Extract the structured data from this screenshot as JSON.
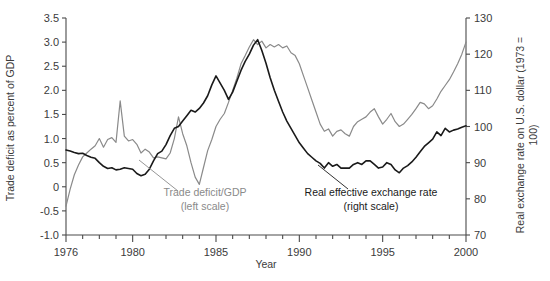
{
  "chart_data": {
    "type": "line",
    "title": "",
    "xlabel": "Year",
    "ylabel_left": "Trade deficit as percent of GDP",
    "ylabel_right": "Real exchange rate on U.S. dollar (1973 = 100)",
    "xlim": [
      1976,
      2000
    ],
    "xticks_major": [
      1976,
      1980,
      1985,
      1990,
      1995,
      2000
    ],
    "xtick_labels": [
      "1976",
      "1980",
      "1985",
      "1990",
      "1995",
      "2000"
    ],
    "xtick_minor_step": 1,
    "ylim_left": [
      -1.0,
      3.5
    ],
    "yticks_left": [
      -1.0,
      -0.5,
      0.0,
      0.5,
      1.0,
      1.5,
      2.0,
      2.5,
      3.0,
      3.5
    ],
    "ytick_labels_left": [
      "-1.0",
      "-0.5",
      "0",
      "0.5",
      "1.0",
      "1.5",
      "2.0",
      "2.5",
      "3.0",
      "3.5"
    ],
    "ylim_right": [
      70,
      130
    ],
    "yticks_right": [
      70,
      80,
      90,
      100,
      110,
      120,
      130
    ],
    "ytick_labels_right": [
      "70",
      "80",
      "90",
      "100",
      "110",
      "120",
      "130"
    ],
    "grid": false,
    "legend_position": "inline-annotations",
    "annotations": [
      {
        "id": "trade-deficit-annotation",
        "line1": "Trade deficit/GDP",
        "line2": "(left scale)",
        "color": "#8a8a8a",
        "text_x": 205,
        "text_y": 196,
        "leader": [
          178,
          191,
          139,
          160
        ]
      },
      {
        "id": "exchange-rate-annotation",
        "line1": "Real effective exchange rate",
        "line2": "(right scale)",
        "color": "#1a1a1a",
        "text_x": 371,
        "text_y": 196,
        "leader": [
          348,
          189,
          318,
          165
        ]
      }
    ],
    "series": [
      {
        "name": "Trade deficit/GDP",
        "scale": "left",
        "color": "#8a8a8a",
        "width": 1.2,
        "x": [
          1976.0,
          1976.25,
          1976.5,
          1976.75,
          1977.0,
          1977.25,
          1977.5,
          1977.75,
          1978.0,
          1978.25,
          1978.5,
          1978.75,
          1979.0,
          1979.25,
          1979.5,
          1979.75,
          1980.0,
          1980.25,
          1980.5,
          1980.75,
          1981.0,
          1981.25,
          1981.5,
          1981.75,
          1982.0,
          1982.25,
          1982.5,
          1982.75,
          1983.0,
          1983.25,
          1983.5,
          1983.75,
          1984.0,
          1984.25,
          1984.5,
          1984.75,
          1985.0,
          1985.25,
          1985.5,
          1985.75,
          1986.0,
          1986.25,
          1986.5,
          1986.75,
          1987.0,
          1987.25,
          1987.5,
          1987.75,
          1988.0,
          1988.25,
          1988.5,
          1988.75,
          1989.0,
          1989.25,
          1989.5,
          1989.75,
          1990.0,
          1990.25,
          1990.5,
          1990.75,
          1991.0,
          1991.25,
          1991.5,
          1991.75,
          1992.0,
          1992.25,
          1992.5,
          1992.75,
          1993.0,
          1993.25,
          1993.5,
          1993.75,
          1994.0,
          1994.25,
          1994.5,
          1994.75,
          1995.0,
          1995.25,
          1995.5,
          1995.75,
          1996.0,
          1996.25,
          1996.5,
          1996.75,
          1997.0,
          1997.25,
          1997.5,
          1997.75,
          1998.0,
          1998.25,
          1998.5,
          1998.75,
          1999.0,
          1999.25,
          1999.5,
          1999.75,
          2000.0
        ],
        "y": [
          -0.4,
          -0.05,
          0.25,
          0.45,
          0.62,
          0.7,
          0.78,
          0.85,
          1.0,
          0.82,
          0.98,
          1.02,
          0.92,
          1.78,
          1.05,
          0.95,
          0.98,
          0.88,
          0.7,
          0.78,
          0.72,
          0.6,
          0.62,
          0.6,
          0.58,
          0.7,
          1.0,
          1.45,
          1.1,
          0.85,
          0.5,
          0.2,
          0.05,
          0.4,
          0.75,
          0.98,
          1.25,
          1.4,
          1.52,
          1.75,
          2.0,
          2.25,
          2.55,
          2.72,
          2.9,
          3.05,
          2.95,
          3.02,
          2.88,
          2.95,
          2.9,
          2.95,
          2.88,
          2.92,
          2.78,
          2.72,
          2.55,
          2.3,
          2.05,
          1.8,
          1.55,
          1.3,
          1.15,
          1.2,
          1.05,
          1.15,
          1.18,
          1.1,
          1.05,
          1.25,
          1.35,
          1.4,
          1.45,
          1.55,
          1.62,
          1.45,
          1.3,
          1.4,
          1.52,
          1.35,
          1.25,
          1.3,
          1.4,
          1.5,
          1.62,
          1.75,
          1.72,
          1.62,
          1.68,
          1.82,
          1.98,
          2.1,
          2.22,
          2.38,
          2.55,
          2.75,
          3.0
        ]
      },
      {
        "name": "Real effective exchange rate",
        "scale": "right",
        "color": "#1a1a1a",
        "width": 1.6,
        "x": [
          1976.0,
          1976.25,
          1976.5,
          1976.75,
          1977.0,
          1977.25,
          1977.5,
          1977.75,
          1978.0,
          1978.25,
          1978.5,
          1978.75,
          1979.0,
          1979.25,
          1979.5,
          1979.75,
          1980.0,
          1980.25,
          1980.5,
          1980.75,
          1981.0,
          1981.25,
          1981.5,
          1981.75,
          1982.0,
          1982.25,
          1982.5,
          1982.75,
          1983.0,
          1983.25,
          1983.5,
          1983.75,
          1984.0,
          1984.25,
          1984.5,
          1984.75,
          1985.0,
          1985.25,
          1985.5,
          1985.75,
          1986.0,
          1986.25,
          1986.5,
          1986.75,
          1987.0,
          1987.25,
          1987.5,
          1987.75,
          1988.0,
          1988.25,
          1988.5,
          1988.75,
          1989.0,
          1989.25,
          1989.5,
          1989.75,
          1990.0,
          1990.25,
          1990.5,
          1990.75,
          1991.0,
          1991.25,
          1991.5,
          1991.75,
          1992.0,
          1992.25,
          1992.5,
          1992.75,
          1993.0,
          1993.25,
          1993.5,
          1993.75,
          1994.0,
          1994.25,
          1994.5,
          1994.75,
          1995.0,
          1995.25,
          1995.5,
          1995.75,
          1996.0,
          1996.25,
          1996.5,
          1996.75,
          1997.0,
          1997.25,
          1997.5,
          1997.75,
          1998.0,
          1998.25,
          1998.5,
          1998.75,
          1999.0,
          1999.25,
          1999.5,
          1999.75,
          2000.0
        ],
        "y": [
          93.5,
          93.2,
          92.8,
          92.5,
          92.6,
          92.0,
          91.5,
          91.2,
          90.0,
          89.0,
          88.4,
          88.6,
          88.0,
          88.2,
          88.6,
          88.4,
          88.2,
          87.0,
          86.4,
          86.8,
          88.2,
          90.5,
          92.5,
          93.2,
          95.0,
          97.5,
          99.5,
          100.0,
          101.5,
          103.0,
          104.5,
          104.0,
          105.0,
          106.5,
          108.5,
          111.5,
          114.0,
          112.0,
          110.0,
          107.5,
          109.5,
          112.5,
          115.5,
          118.0,
          120.0,
          122.5,
          124.0,
          121.0,
          117.5,
          113.5,
          110.0,
          107.0,
          104.0,
          101.5,
          99.5,
          97.5,
          95.5,
          94.0,
          92.5,
          91.5,
          90.5,
          89.8,
          88.5,
          90.0,
          89.0,
          89.5,
          88.5,
          88.5,
          88.5,
          89.5,
          90.0,
          89.5,
          90.5,
          90.5,
          89.5,
          88.5,
          88.8,
          90.0,
          89.5,
          88.0,
          87.2,
          88.5,
          89.2,
          90.2,
          91.5,
          93.0,
          94.5,
          95.5,
          96.5,
          98.5,
          97.5,
          99.5,
          98.5,
          99.0,
          99.3,
          99.8,
          100.2
        ]
      }
    ]
  }
}
